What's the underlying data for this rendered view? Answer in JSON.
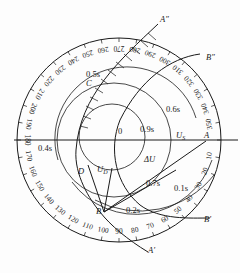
{
  "diagram": {
    "type": "polar-dial-phasor-diagram",
    "dial": {
      "center": [
        119,
        140
      ],
      "radius": 102,
      "tick_labels": [
        "10",
        "20",
        "30",
        "40",
        "50",
        "60",
        "70",
        "80",
        "90",
        "100",
        "110",
        "120",
        "130",
        "140",
        "150",
        "160",
        "170",
        "180",
        "190",
        "200",
        "210",
        "220",
        "230",
        "240",
        "250",
        "260",
        "270",
        "280",
        "290",
        "300",
        "310",
        "320",
        "330",
        "340",
        "350"
      ],
      "unit": "degrees"
    },
    "time_circles": [
      {
        "label": "0.9s"
      },
      {
        "label": "0.6s"
      },
      {
        "label": "0.4s"
      },
      {
        "label": "0.5s"
      },
      {
        "label": "0.7s"
      },
      {
        "label": "0.1s"
      },
      {
        "label": "0.2s"
      }
    ],
    "points": {
      "origin": "0",
      "A": "A",
      "B": "B",
      "C": "C",
      "D": "D",
      "A_prime": "A′",
      "A_double_prime": "A″",
      "B_prime": "B′",
      "B_double_prime": "B″"
    },
    "phasors": {
      "Us": "U",
      "Us_sub": "S",
      "Ud": "U",
      "Ud_sub": "D",
      "dU": "ΔU"
    }
  }
}
